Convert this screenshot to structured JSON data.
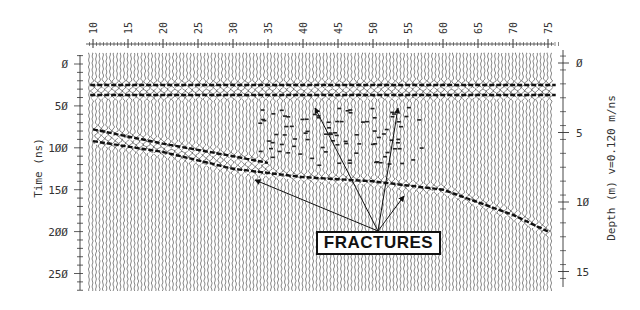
{
  "figure": {
    "type": "GPR radargram (ground-penetrating radar profile)",
    "annotation_label": "FRACTURES",
    "left_axis": {
      "title": "Time (ns)",
      "ticks": [
        "0",
        "50",
        "100",
        "150",
        "200",
        "250"
      ]
    },
    "right_axis": {
      "title": "Depth (m) v=0.120 m/ns",
      "ticks": [
        "0",
        "5",
        "10",
        "15"
      ]
    },
    "top_axis": {
      "title": "",
      "ticks": [
        "10",
        "15",
        "20",
        "25",
        "30",
        "35",
        "40",
        "45",
        "50",
        "55",
        "60",
        "65",
        "70",
        "75"
      ]
    }
  },
  "chart_data": {
    "type": "heatmap",
    "title": "",
    "xlabel": "Trace position (top ruler)",
    "ylabel": "Time (ns)",
    "y2label": "Depth (m) v=0.120 m/ns",
    "x_ticks": [
      10,
      15,
      20,
      25,
      30,
      35,
      40,
      45,
      50,
      55,
      60,
      65,
      70,
      75
    ],
    "y_ticks": [
      0,
      50,
      100,
      150,
      200,
      250
    ],
    "y2_ticks": [
      0,
      5,
      10,
      15
    ],
    "xlim": [
      9.5,
      76.5
    ],
    "ylim": [
      270,
      -10
    ],
    "y2lim": [
      16,
      -0.8
    ],
    "velocity_m_per_ns": 0.12,
    "reflectors": [
      {
        "name": "direct wave / surface",
        "x": [
          9.5,
          76.5
        ],
        "time_ns": [
          25,
          25
        ]
      },
      {
        "name": "shallow horizontal reflector",
        "x": [
          9.5,
          76.5
        ],
        "time_ns": [
          37,
          37
        ]
      },
      {
        "name": "dipping reflector A",
        "x": [
          10,
          20,
          30,
          35
        ],
        "time_ns": [
          78,
          95,
          110,
          118
        ]
      },
      {
        "name": "dipping reflector B",
        "x": [
          10,
          20,
          30,
          40,
          50,
          60,
          70,
          75
        ],
        "time_ns": [
          92,
          105,
          125,
          135,
          140,
          150,
          180,
          200
        ]
      }
    ],
    "annotations": [
      {
        "text": "FRACTURES",
        "x": 50,
        "time_ns": 205,
        "arrows_to": [
          [
            33,
            128
          ],
          [
            40,
            68
          ],
          [
            54,
            68
          ],
          [
            55,
            140
          ]
        ]
      }
    ],
    "grid": false,
    "legend": null
  }
}
